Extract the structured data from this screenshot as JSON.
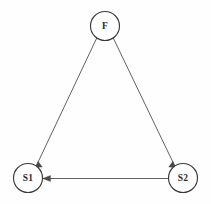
{
  "diagram": {
    "type": "state-transition-graph",
    "title": "",
    "background_color": "#fefefe",
    "node_stroke_color": "#3a3a3a",
    "edge_color": "#585858",
    "label_color": "#2a2a2a",
    "nodes": [
      {
        "id": "F",
        "label": "F",
        "cx": 105,
        "cy": 26,
        "r": 14.5
      },
      {
        "id": "S1",
        "label": "S1",
        "cx": 28,
        "cy": 178,
        "r": 14.5
      },
      {
        "id": "S2",
        "label": "S2",
        "cx": 183,
        "cy": 178,
        "r": 14.5
      }
    ],
    "edges": [
      {
        "id": "f-to-s1",
        "from": "F",
        "to": "S1",
        "label": "",
        "directed": true,
        "x1": 96.8,
        "y1": 37.9,
        "x2": 36.2,
        "y2": 166.1,
        "head": "38.1,161.2 35.6,167.4 42.3,167.0"
      },
      {
        "id": "f-to-s2",
        "from": "F",
        "to": "S2",
        "label": "",
        "directed": true,
        "x1": 113.2,
        "y1": 37.9,
        "x2": 174.8,
        "y2": 166.1,
        "head": "172.9,161.2 175.4,167.4 168.7,167.0"
      },
      {
        "id": "s2-to-s1",
        "from": "S2",
        "to": "S1",
        "label": "",
        "directed": true,
        "x1": 168.5,
        "y1": 178.5,
        "x2": 42.5,
        "y2": 178.5,
        "head": "42.5,178.5 50.5,175.4 50.5,181.6"
      }
    ]
  }
}
